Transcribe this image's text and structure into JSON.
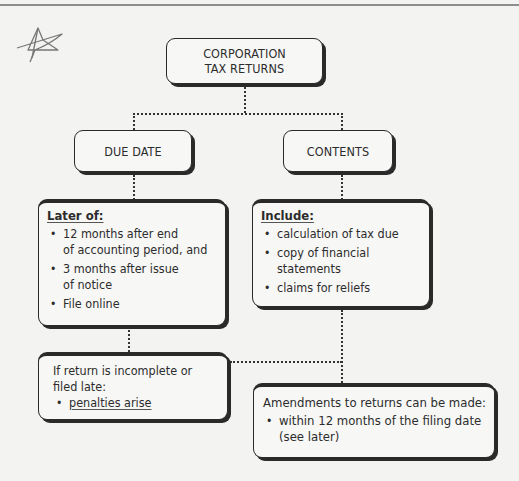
{
  "diagram": {
    "title": {
      "line1": "CORPORATION",
      "line2": "TAX RETURNS"
    },
    "branches": [
      {
        "label": "DUE DATE",
        "box": {
          "heading": "Later of:",
          "items": [
            {
              "line1": "12 months after end",
              "line2": "of accounting period, and"
            },
            {
              "line1": "3 months after issue",
              "line2": "of notice"
            },
            {
              "line1": "File online"
            }
          ]
        }
      },
      {
        "label": "CONTENTS",
        "box": {
          "heading": "Include:",
          "items": [
            {
              "line1": "calculation of tax due"
            },
            {
              "line1": "copy of financial",
              "line2": "statements"
            },
            {
              "line1": "claims for reliefs"
            }
          ]
        }
      }
    ],
    "penalties": {
      "line1": "If return is incomplete or",
      "line2": "filed late:",
      "items": [
        "penalties arise"
      ]
    },
    "amendments": {
      "heading": "Amendments to returns can be made:",
      "item_line1": "within 12 months of the filing date",
      "item_line2": "(see later)"
    },
    "annotation": {
      "icon": "star-doodle-icon"
    }
  },
  "colors": {
    "background": "#f3f3f2",
    "border": "#2a2a2a",
    "text": "#2c2c2c"
  }
}
